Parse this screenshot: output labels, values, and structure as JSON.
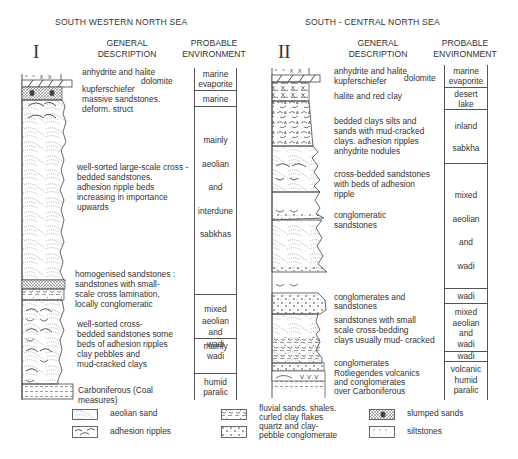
{
  "sections": [
    {
      "id": "I",
      "roman": "I",
      "title": "SOUTH  WESTERN NORTH SEA",
      "headers": {
        "description": [
          "GENERAL",
          "DESCRIPTION"
        ],
        "environment": [
          "PROBABLE",
          "ENVIRONMENT"
        ]
      },
      "descriptions": [
        {
          "text": "anhydrite and halite"
        },
        {
          "text": "dolomite"
        },
        {
          "text": "kupferschiefer"
        },
        {
          "text": "massive sandstones."
        },
        {
          "text": "deform. struct"
        },
        {
          "text": "well-sorted large-scale cross -"
        },
        {
          "text": "bedded sandstones."
        },
        {
          "text": "adhesion ripple beds"
        },
        {
          "text": "increasing in importance"
        },
        {
          "text": "upwards"
        },
        {
          "text": "homogenised sandstones :"
        },
        {
          "text": "sandstones with small-"
        },
        {
          "text": "scale cross lamination,"
        },
        {
          "text": "locally conglomeratic"
        },
        {
          "text": "well-sorted cross-"
        },
        {
          "text": "bedded sandstones some"
        },
        {
          "text": "beds of adhesion ripples"
        },
        {
          "text": "clay pebbles and"
        },
        {
          "text": "mud-cracked clays"
        },
        {
          "text": "Carboniferous (Coal"
        },
        {
          "text": "measures)"
        }
      ],
      "environments": [
        {
          "lines": [
            "marine",
            "evaporite"
          ]
        },
        {
          "lines": [
            "marine"
          ]
        },
        {
          "lines": [
            "mainly",
            "aeolian",
            "and",
            "interdune",
            "sabkhas"
          ]
        },
        {
          "lines": [
            "mainly",
            "wadi"
          ]
        },
        {
          "lines": [
            "mixed",
            "aeolian",
            "and",
            "wadi"
          ]
        },
        {
          "lines": [
            "humid",
            "paralic"
          ]
        }
      ]
    },
    {
      "id": "II",
      "roman": "II",
      "title": "SOUTH - CENTRAL NORTH SEA",
      "headers": {
        "description": [
          "GENERAL",
          "DESCRIPTION"
        ],
        "environment": [
          "PROBABLE",
          "ENVIRONMENT"
        ]
      },
      "descriptions": [
        {
          "text": "anhydrite and halite"
        },
        {
          "text": "dolomite"
        },
        {
          "text": "kupferschiefer"
        },
        {
          "text": "halite and red clay"
        },
        {
          "text": "bedded clays silts and"
        },
        {
          "text": "sands with mud-cracked"
        },
        {
          "text": "clays. adhesion ripples"
        },
        {
          "text": "anhydrite nodules"
        },
        {
          "text": "cross-bedded sandstones"
        },
        {
          "text": "with beds of adhesion"
        },
        {
          "text": "ripple"
        },
        {
          "text": "conglomeratic"
        },
        {
          "text": "sandstones"
        },
        {
          "text": "conglomerates and"
        },
        {
          "text": "sandstones"
        },
        {
          "text": "sandstones with small"
        },
        {
          "text": "scale cross-bedding"
        },
        {
          "text": "clays usually mud- cracked"
        },
        {
          "text": "conglomerates"
        },
        {
          "text": "Rotliegendes volcanics"
        },
        {
          "text": "and conglomerates"
        },
        {
          "text": "over Carboniferous"
        }
      ],
      "environments": [
        {
          "lines": [
            "marine",
            "evaporite"
          ]
        },
        {
          "lines": [
            "desert",
            "lake"
          ]
        },
        {
          "lines": [
            "inland",
            "sabkha"
          ]
        },
        {
          "lines": [
            "mixed",
            "aeolian",
            "and",
            "wadi"
          ]
        },
        {
          "lines": [
            "wadi"
          ]
        },
        {
          "lines": [
            "mixed",
            "aeolian",
            "and",
            "wadi"
          ]
        },
        {
          "lines": [
            "wadi"
          ]
        },
        {
          "lines": [
            "volcanic",
            "humid",
            "paralic"
          ]
        }
      ]
    }
  ],
  "legend": [
    {
      "icon": "aeolian-sand-pattern",
      "label": [
        "aeolian sand"
      ]
    },
    {
      "icon": "adhesion-ripples-pattern",
      "label": [
        "adhesion ripples"
      ]
    },
    {
      "icon": "fluvial-sands-pattern",
      "label": [
        "fluvial sands. shales.",
        "curled clay flakes"
      ]
    },
    {
      "icon": "conglomerate-pattern",
      "label": [
        "quartz and clay-",
        "pebble conglomerate"
      ]
    },
    {
      "icon": "slumped-sands-pattern",
      "label": [
        "slumped sands"
      ]
    },
    {
      "icon": "siltstones-pattern",
      "label": [
        "siltstones"
      ]
    }
  ],
  "colors": {
    "ink": "#333333",
    "line": "#555555",
    "background": "#ffffff"
  }
}
